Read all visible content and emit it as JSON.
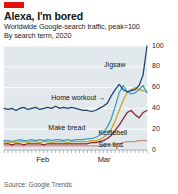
{
  "header": {
    "tag_color": "#e3120b",
    "title": "Alexa, I'm bored",
    "subtitle": "Worldwide Google-search traffic, peak=100",
    "subtitle2": "By search term, 2020"
  },
  "footer": {
    "source": "Source: Google Trends"
  },
  "chart_data": {
    "type": "line",
    "title": "Alexa, I'm bored",
    "subtitle": "Worldwide Google-search traffic, peak=100",
    "subtitle2": "By search term, 2020",
    "xlabel": "",
    "ylabel": "",
    "ylim": [
      0,
      100
    ],
    "yticks": [
      0,
      20,
      40,
      60,
      80,
      100
    ],
    "ytick_labels": [
      "0",
      "20",
      "40",
      "60",
      "80",
      "100"
    ],
    "y_axis_position": "right",
    "grid": true,
    "grid_color": "#ffffff",
    "plot_background": "#e2e9ec",
    "x": [
      "Jan 19",
      "Jan 21",
      "Jan 23",
      "Jan 25",
      "Jan 27",
      "Jan 29",
      "Jan 31",
      "Feb 2",
      "Feb 4",
      "Feb 6",
      "Feb 8",
      "Feb 10",
      "Feb 12",
      "Feb 14",
      "Feb 16",
      "Feb 18",
      "Feb 20",
      "Feb 22",
      "Feb 24",
      "Feb 26",
      "Feb 28",
      "Mar 1",
      "Mar 3",
      "Mar 5",
      "Mar 7",
      "Mar 9",
      "Mar 11",
      "Mar 13",
      "Mar 15",
      "Mar 17",
      "Mar 19",
      "Mar 21",
      "Mar 23",
      "Mar 25",
      "Mar 27",
      "Mar 29",
      "Mar 31"
    ],
    "xticks": [
      "Feb",
      "Mar"
    ],
    "xtick_labels": [
      "Feb",
      "Mar"
    ],
    "legend_position": "inline-annotations",
    "series": [
      {
        "name": "Jigsaw",
        "color": "#1c3f6e",
        "label_position": "top-right",
        "values": [
          40,
          39,
          40,
          38,
          40,
          41,
          39,
          40,
          41,
          39,
          40,
          41,
          40,
          42,
          40,
          41,
          40,
          41,
          40,
          39,
          38,
          38,
          37,
          38,
          40,
          42,
          45,
          52,
          58,
          63,
          58,
          56,
          57,
          58,
          62,
          72,
          100
        ]
      },
      {
        "name": "Home workout",
        "color": "#3e9ab5",
        "label_position": "mid-left",
        "values": [
          9,
          9,
          8,
          9,
          10,
          9,
          9,
          10,
          9,
          10,
          9,
          10,
          9,
          10,
          10,
          9,
          10,
          9,
          10,
          10,
          10,
          11,
          11,
          12,
          14,
          17,
          22,
          30,
          42,
          55,
          62,
          56,
          54,
          55,
          58,
          62,
          55
        ]
      },
      {
        "name": "Kettlebell",
        "color": "#8b1f2b",
        "label_position": "mid-right",
        "values": [
          6,
          6,
          5,
          6,
          6,
          5,
          6,
          6,
          6,
          6,
          5,
          6,
          6,
          6,
          6,
          6,
          6,
          6,
          6,
          6,
          6,
          6,
          7,
          7,
          8,
          9,
          11,
          14,
          19,
          24,
          30,
          36,
          38,
          34,
          31,
          36,
          38
        ]
      },
      {
        "name": "Make bread",
        "color": "#c9a227",
        "label_position": "bottom-left",
        "values": [
          8,
          7,
          8,
          7,
          8,
          8,
          7,
          8,
          8,
          7,
          8,
          8,
          7,
          8,
          8,
          8,
          7,
          8,
          8,
          8,
          8,
          8,
          9,
          9,
          10,
          12,
          15,
          20,
          28,
          38,
          48,
          55,
          58,
          60,
          58,
          57,
          56
        ]
      },
      {
        "name": "Sex tips",
        "color": "#c98b8b",
        "label_position": "bottom-right",
        "values": [
          4,
          4,
          4,
          4,
          4,
          4,
          4,
          4,
          4,
          4,
          4,
          4,
          4,
          4,
          4,
          4,
          4,
          4,
          4,
          4,
          4,
          4,
          4,
          4,
          4,
          4,
          5,
          5,
          5,
          6,
          7,
          8,
          8,
          8,
          9,
          9,
          9
        ]
      }
    ],
    "annotations": [
      {
        "text": "Jigsaw",
        "x_frac": 0.7,
        "y_frac": 0.14,
        "arrow": false
      },
      {
        "text": "Home workout",
        "x_frac": 0.33,
        "y_frac": 0.46,
        "arrow": true
      },
      {
        "text": "Make bread",
        "x_frac": 0.31,
        "y_frac": 0.75,
        "arrow": false
      },
      {
        "text": "Kettlebell",
        "x_frac": 0.66,
        "y_frac": 0.8,
        "arrow": false
      },
      {
        "text": "Sex tips",
        "x_frac": 0.66,
        "y_frac": 0.91,
        "arrow": false
      }
    ]
  }
}
